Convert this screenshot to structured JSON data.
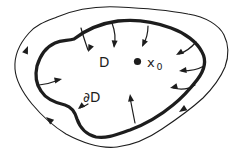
{
  "figure": {
    "background_color": "#ffffff",
    "ink_color": "#1d1d1d",
    "labels": {
      "domain": "D",
      "boundary": "∂D",
      "point_name": "x",
      "point_subscript": "0"
    },
    "elements": {
      "outer_flow_curve": "thin closed curve with 3 clockwise tangent arrowheads",
      "domain_boundary": "thick closed curve ∂D",
      "inward_arrows_count": 8,
      "marked_point": "filled dot x0 inside D"
    }
  }
}
